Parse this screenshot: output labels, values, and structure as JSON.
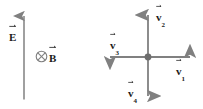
{
  "figure": {
    "background_color": "#ffffff",
    "line_color": "#808080",
    "label_color": "#1a1a1a"
  },
  "fields": {
    "electric": {
      "symbol": "E",
      "label_name": "electric-field-label",
      "direction": "up",
      "arrow_name": "electric-field-arrow"
    },
    "magnetic": {
      "symbol": "B",
      "label_name": "magnetic-field-label",
      "direction": "into-page",
      "marker_name": "b-into-page-icon",
      "marker_glyph": "cross-in-circle"
    }
  },
  "vectors": {
    "origin_marker_name": "origin-dot",
    "items": [
      {
        "symbol": "v",
        "subscript": "1",
        "direction": "right",
        "name": "vector-v1"
      },
      {
        "symbol": "v",
        "subscript": "2",
        "direction": "up",
        "name": "vector-v2"
      },
      {
        "symbol": "v",
        "subscript": "3",
        "direction": "left",
        "name": "vector-v3"
      },
      {
        "symbol": "v",
        "subscript": "4",
        "direction": "down",
        "name": "vector-v4"
      }
    ]
  }
}
